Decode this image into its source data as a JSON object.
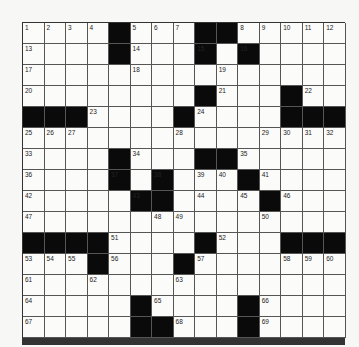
{
  "puzzle": {
    "size": 15,
    "colors": {
      "black": "#0a0a0a",
      "white": "#fbfbfa",
      "line": "#555555"
    },
    "rows": [
      "....#...##.....",
      "....#...#.#....",
      "...............",
      "........#...#..",
      "###....#....###",
      "...............",
      "....#...##.....",
      "....#.#...#....",
      ".....##....#...",
      "...............",
      "####....#...###",
      "...#...#.......",
      "...............",
      ".....#....#....",
      ".....##...#...."
    ],
    "numbers": [
      {
        "r": 0,
        "c": 0,
        "n": "1"
      },
      {
        "r": 0,
        "c": 1,
        "n": "2"
      },
      {
        "r": 0,
        "c": 2,
        "n": "3"
      },
      {
        "r": 0,
        "c": 3,
        "n": "4"
      },
      {
        "r": 0,
        "c": 5,
        "n": "5"
      },
      {
        "r": 0,
        "c": 6,
        "n": "6"
      },
      {
        "r": 0,
        "c": 7,
        "n": "7"
      },
      {
        "r": 0,
        "c": 10,
        "n": "8"
      },
      {
        "r": 0,
        "c": 11,
        "n": "9"
      },
      {
        "r": 0,
        "c": 12,
        "n": "10"
      },
      {
        "r": 0,
        "c": 13,
        "n": "11"
      },
      {
        "r": 0,
        "c": 14,
        "n": "12"
      },
      {
        "r": 1,
        "c": 0,
        "n": "13"
      },
      {
        "r": 1,
        "c": 5,
        "n": "14"
      },
      {
        "r": 1,
        "c": 8,
        "n": "15"
      },
      {
        "r": 1,
        "c": 10,
        "n": "16"
      },
      {
        "r": 2,
        "c": 0,
        "n": "17"
      },
      {
        "r": 2,
        "c": 5,
        "n": "18"
      },
      {
        "r": 2,
        "c": 9,
        "n": "19"
      },
      {
        "r": 3,
        "c": 0,
        "n": "20"
      },
      {
        "r": 3,
        "c": 9,
        "n": "21"
      },
      {
        "r": 3,
        "c": 13,
        "n": "22"
      },
      {
        "r": 4,
        "c": 3,
        "n": "23"
      },
      {
        "r": 4,
        "c": 8,
        "n": "24"
      },
      {
        "r": 5,
        "c": 0,
        "n": "25"
      },
      {
        "r": 5,
        "c": 1,
        "n": "26"
      },
      {
        "r": 5,
        "c": 2,
        "n": "27"
      },
      {
        "r": 5,
        "c": 7,
        "n": "28"
      },
      {
        "r": 5,
        "c": 11,
        "n": "29"
      },
      {
        "r": 5,
        "c": 12,
        "n": "30"
      },
      {
        "r": 5,
        "c": 13,
        "n": "31"
      },
      {
        "r": 5,
        "c": 14,
        "n": "32"
      },
      {
        "r": 6,
        "c": 0,
        "n": "33"
      },
      {
        "r": 6,
        "c": 5,
        "n": "34"
      },
      {
        "r": 6,
        "c": 10,
        "n": "35"
      },
      {
        "r": 7,
        "c": 0,
        "n": "36"
      },
      {
        "r": 7,
        "c": 4,
        "n": "37"
      },
      {
        "r": 7,
        "c": 6,
        "n": "38"
      },
      {
        "r": 7,
        "c": 8,
        "n": "39"
      },
      {
        "r": 7,
        "c": 9,
        "n": "40"
      },
      {
        "r": 7,
        "c": 11,
        "n": "41"
      },
      {
        "r": 8,
        "c": 0,
        "n": "42"
      },
      {
        "r": 8,
        "c": 5,
        "n": "43"
      },
      {
        "r": 8,
        "c": 8,
        "n": "44"
      },
      {
        "r": 8,
        "c": 10,
        "n": "45"
      },
      {
        "r": 8,
        "c": 12,
        "n": "46"
      },
      {
        "r": 9,
        "c": 0,
        "n": "47"
      },
      {
        "r": 9,
        "c": 6,
        "n": "48"
      },
      {
        "r": 9,
        "c": 7,
        "n": "49"
      },
      {
        "r": 9,
        "c": 11,
        "n": "50"
      },
      {
        "r": 10,
        "c": 4,
        "n": "51"
      },
      {
        "r": 10,
        "c": 9,
        "n": "52"
      },
      {
        "r": 11,
        "c": 0,
        "n": "53"
      },
      {
        "r": 11,
        "c": 1,
        "n": "54"
      },
      {
        "r": 11,
        "c": 2,
        "n": "55"
      },
      {
        "r": 11,
        "c": 4,
        "n": "56"
      },
      {
        "r": 11,
        "c": 8,
        "n": "57"
      },
      {
        "r": 11,
        "c": 12,
        "n": "58"
      },
      {
        "r": 11,
        "c": 13,
        "n": "59"
      },
      {
        "r": 11,
        "c": 14,
        "n": "60"
      },
      {
        "r": 12,
        "c": 0,
        "n": "61"
      },
      {
        "r": 12,
        "c": 3,
        "n": "62"
      },
      {
        "r": 12,
        "c": 7,
        "n": "63"
      },
      {
        "r": 13,
        "c": 0,
        "n": "64"
      },
      {
        "r": 13,
        "c": 6,
        "n": "65"
      },
      {
        "r": 13,
        "c": 11,
        "n": "66"
      },
      {
        "r": 14,
        "c": 0,
        "n": "67"
      },
      {
        "r": 14,
        "c": 7,
        "n": "68"
      },
      {
        "r": 14,
        "c": 11,
        "n": "69"
      }
    ]
  }
}
